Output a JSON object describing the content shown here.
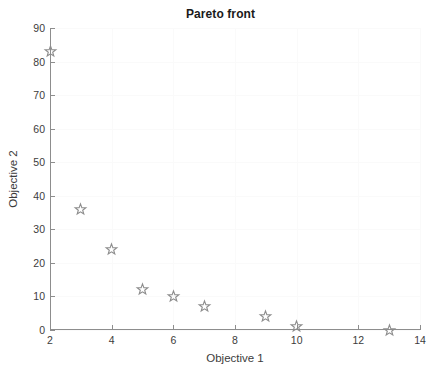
{
  "chart_data": {
    "type": "scatter",
    "title": "Pareto front",
    "xlabel": "Objective 1",
    "ylabel": "Objective 2",
    "xlim": [
      2,
      14
    ],
    "ylim": [
      0,
      90
    ],
    "xticks": [
      2,
      4,
      6,
      8,
      10,
      12,
      14
    ],
    "yticks": [
      0,
      10,
      20,
      30,
      40,
      50,
      60,
      70,
      80,
      90
    ],
    "xtick_labels": [
      "2",
      "4",
      "6",
      "8",
      "10",
      "12",
      "14"
    ],
    "ytick_labels": [
      "0",
      "10",
      "20",
      "30",
      "40",
      "50",
      "60",
      "70",
      "80",
      "90"
    ],
    "grid": true,
    "legend": null,
    "marker": "star",
    "marker_color": "#8d8d8d",
    "series": [
      {
        "name": "Pareto front",
        "x": [
          2,
          3,
          4,
          5,
          6,
          7,
          9,
          10,
          13
        ],
        "y": [
          83,
          36,
          24,
          12,
          10,
          7,
          4,
          1,
          0
        ]
      }
    ]
  },
  "colors": {
    "axis": "#8d8d8d",
    "text": "#3c3c3c",
    "title": "#1a1a1a",
    "grid": "#fafafa",
    "background": "#ffffff"
  }
}
